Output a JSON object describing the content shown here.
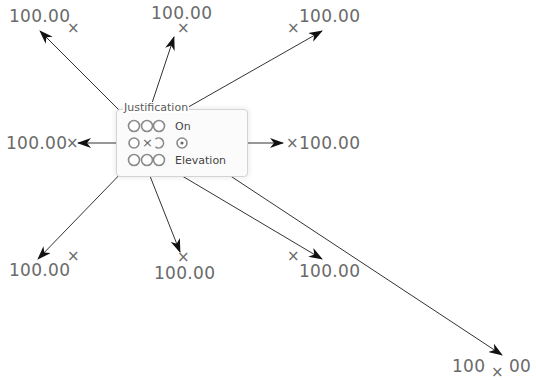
{
  "group": {
    "title": "Justification",
    "options": [
      "On",
      "Elevation"
    ],
    "center_mark": "×"
  },
  "callouts": {
    "top_left": {
      "value": "100.00",
      "mark": "×"
    },
    "top_center": {
      "value": "100.00",
      "mark": "×"
    },
    "top_right": {
      "value": "100.00",
      "mark": "×"
    },
    "middle_left": {
      "value": "100.00",
      "mark": "×"
    },
    "middle_right": {
      "value": "100.00",
      "mark": "×"
    },
    "bottom_left": {
      "value": "100.00",
      "mark": "×"
    },
    "bottom_center": {
      "value": "100.00",
      "mark": "×"
    },
    "bottom_right": {
      "value": "100.00",
      "mark": "×"
    },
    "far_bottom_right": {
      "value_left": "100",
      "value_right": "00",
      "mark": "×"
    }
  },
  "colors": {
    "text": "#6a6a6a",
    "line": "#333333",
    "radio_ring": "#8a8a8a"
  }
}
